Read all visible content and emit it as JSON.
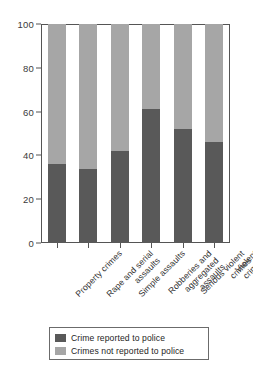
{
  "chart_data": {
    "type": "bar",
    "subtype": "stacked-bar-100-percent",
    "title": "",
    "xlabel": "",
    "ylabel": "",
    "ylim": [
      0,
      100
    ],
    "yticks": [
      0,
      20,
      40,
      60,
      80,
      100
    ],
    "ytick_labels": [
      "0",
      "20",
      "40",
      "60",
      "80",
      "100"
    ],
    "grid": false,
    "legend_position": "below-plot",
    "categories": [
      "Property crimes",
      "Rape and serial assaults",
      "Simple assaults",
      "Robberies and aggregated assaults",
      "Serious violent crimes",
      "Violent crimes"
    ],
    "category_label_lines": [
      [
        "Property crimes"
      ],
      [
        "Rape and serial",
        "assaults"
      ],
      [
        "Simple assaults"
      ],
      [
        "Robberies and",
        "aggregated",
        "assaults"
      ],
      [
        "Serious violent",
        "crimes"
      ],
      [
        "Violent crimes"
      ]
    ],
    "series": [
      {
        "name": "Crime reported to police",
        "color": "#595959",
        "values": [
          36,
          34,
          42,
          61,
          52,
          46
        ]
      },
      {
        "name": "Crimes not reported to police",
        "color": "#a6a6a6",
        "values": [
          64,
          66,
          58,
          39,
          48,
          54
        ]
      }
    ]
  },
  "legend": {
    "items": [
      {
        "label": "Crime reported to police",
        "color": "#595959"
      },
      {
        "label": "Crimes not reported to police",
        "color": "#a6a6a6"
      }
    ]
  },
  "colors": {
    "reported": "#595959",
    "not_reported": "#a6a6a6",
    "axis": "#555555",
    "text": "#2f2f2f",
    "background": "#ffffff"
  },
  "top_cropped_text": ""
}
